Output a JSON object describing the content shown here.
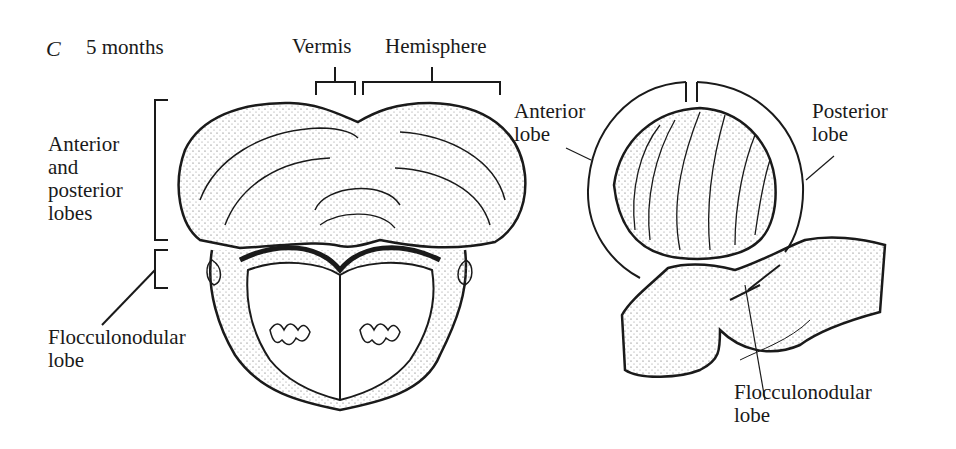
{
  "figure": {
    "panel_letter": "C",
    "panel_title": "5 months",
    "left_view": {
      "labels": {
        "vermis": "Vermis",
        "hemisphere": "Hemisphere",
        "anterior_posterior": [
          "Anterior",
          "and",
          "posterior",
          "lobes"
        ],
        "flocculonodular": [
          "Flocculonodular",
          "lobe"
        ]
      }
    },
    "right_view": {
      "labels": {
        "anterior_lobe": [
          "Anterior",
          "lobe"
        ],
        "posterior_lobe": [
          "Posterior",
          "lobe"
        ],
        "flocculonodular": [
          "Flocculonodular",
          "lobe"
        ]
      }
    },
    "colors": {
      "ink": "#1a1a1a",
      "background": "#ffffff"
    }
  }
}
